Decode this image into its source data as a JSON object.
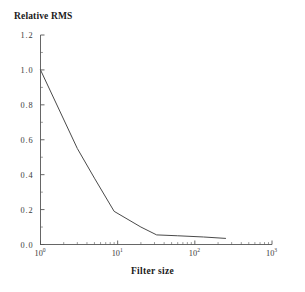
{
  "chart_data": {
    "type": "line",
    "title": "",
    "xlabel": "Filter size",
    "ylabel": "Relative RMS",
    "xscale": "log",
    "yscale": "linear",
    "xlim": [
      1,
      1000
    ],
    "ylim": [
      0.0,
      1.2
    ],
    "grid": false,
    "legend": null,
    "x_tick_labels": [
      "10^0",
      "10^1",
      "10^2",
      "10^3"
    ],
    "x_tick_values": [
      1,
      10,
      100,
      1000
    ],
    "x_tick_mantissa": [
      "10",
      "10",
      "10",
      "10"
    ],
    "x_tick_exponents": [
      "0",
      "1",
      "2",
      "3"
    ],
    "y_tick_labels": [
      "0.0",
      "0.2",
      "0.4",
      "0.6",
      "0.8",
      "1.0",
      "1.2"
    ],
    "y_tick_values": [
      0.0,
      0.2,
      0.4,
      0.6,
      0.8,
      1.0,
      1.2
    ],
    "series": [
      {
        "name": "Relative RMS",
        "color": "#4a4a4a",
        "x": [
          1.0,
          3.0,
          5.0,
          9.0,
          20.0,
          32.0,
          60.0,
          130.0,
          250.0
        ],
        "y": [
          1.0,
          0.55,
          0.38,
          0.19,
          0.1,
          0.055,
          0.05,
          0.043,
          0.035
        ]
      }
    ]
  },
  "axis_titles": {
    "y": "Relative RMS",
    "x": "Filter size"
  }
}
